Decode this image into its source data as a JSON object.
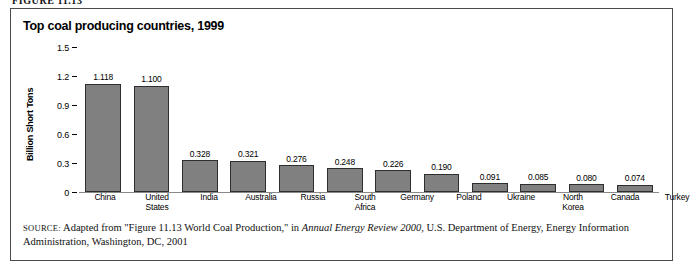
{
  "figure": {
    "top_caption_sliver": "FIGURE 11.13",
    "title": "Top coal producing countries, 1999"
  },
  "source": {
    "label": "SOURCE:",
    "text_part1": " Adapted from \"Figure 11.13 World Coal Production,\" in ",
    "italic_title": "Annual Energy Review 2000",
    "text_part2": ", U.S. Department of Energy, Energy Information Administration, Washington, DC, 2001"
  },
  "chart_data": {
    "type": "bar",
    "title": "Top coal producing countries, 1999",
    "xlabel": "",
    "ylabel": "Billion Short Tons",
    "ylim": [
      0,
      1.5
    ],
    "yticks": [
      "0",
      "0.3",
      "0.6",
      "0.9",
      "1.2",
      "1.5"
    ],
    "ytick_values": [
      0,
      0.3,
      0.6,
      0.9,
      1.2,
      1.5
    ],
    "grid": false,
    "legend": false,
    "bar_color": "#808080",
    "bar_border_color": "#2e2e2e",
    "categories": [
      "China",
      "United States",
      "India",
      "Australia",
      "Russia",
      "South Africa",
      "Germany",
      "Poland",
      "Ukraine",
      "North Korea",
      "Canada",
      "Turkey"
    ],
    "values": [
      1.118,
      1.1,
      0.328,
      0.321,
      0.276,
      0.248,
      0.226,
      0.19,
      0.091,
      0.085,
      0.08,
      0.074
    ],
    "value_labels": [
      "1.118",
      "1.100",
      "0.328",
      "0.321",
      "0.276",
      "0.248",
      "0.226",
      "0.190",
      "0.091",
      "0.085",
      "0.080",
      "0.074"
    ]
  }
}
